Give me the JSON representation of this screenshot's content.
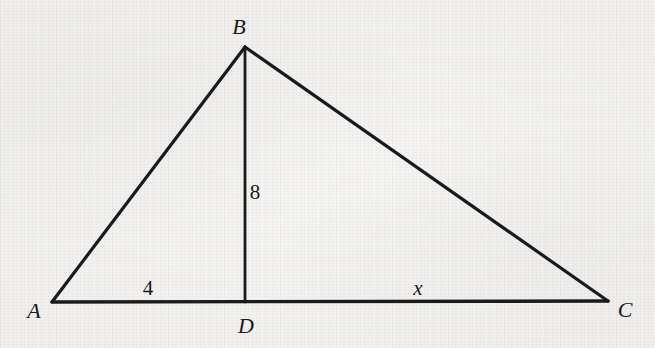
{
  "figure": {
    "type": "geometry-diagram",
    "shape": "triangle-with-altitude",
    "background_color": "#f1f0ee",
    "ink_color": "#1a1a1a",
    "canvas": {
      "width": 655,
      "height": 348
    },
    "vertices": [
      {
        "name": "A",
        "label": "A",
        "x": 52,
        "y": 302,
        "label_x": 34,
        "label_y": 311
      },
      {
        "name": "B",
        "label": "B",
        "x": 245,
        "y": 47,
        "label_x": 239,
        "label_y": 27
      },
      {
        "name": "C",
        "label": "C",
        "x": 608,
        "y": 301,
        "label_x": 625,
        "label_y": 310
      },
      {
        "name": "D",
        "label": "D",
        "x": 245,
        "y": 302,
        "label_x": 246,
        "label_y": 326
      }
    ],
    "segments": [
      {
        "name": "side-AB",
        "from": "A",
        "to": "B"
      },
      {
        "name": "side-BC",
        "from": "B",
        "to": "C"
      },
      {
        "name": "base-AC",
        "from": "A",
        "to": "C"
      },
      {
        "name": "altitude-BD",
        "from": "B",
        "to": "D"
      }
    ],
    "measures": [
      {
        "name": "segment-AD-length",
        "text": "4",
        "style": "upright",
        "x": 148,
        "y": 288
      },
      {
        "name": "altitude-BD-length",
        "text": "8",
        "style": "upright",
        "x": 255,
        "y": 192
      },
      {
        "name": "segment-DC-length",
        "text": "x",
        "style": "italic",
        "x": 418,
        "y": 288
      }
    ]
  }
}
